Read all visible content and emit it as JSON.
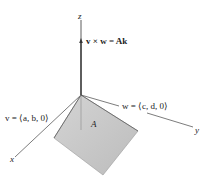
{
  "diagram": {
    "axes": {
      "x_label": "x",
      "y_label": "y",
      "z_label": "z"
    },
    "labels": {
      "cross_product": "v × w = Ak",
      "vector_v": "v = ⟨a, b, 0⟩",
      "vector_w": "w = ⟨c, d, 0⟩",
      "area": "A"
    },
    "colors": {
      "parallelogram_fill": "#c8c8c8",
      "parallelogram_edge": "#8a8a8a",
      "axis": "#333333",
      "vector": "#555555"
    }
  }
}
